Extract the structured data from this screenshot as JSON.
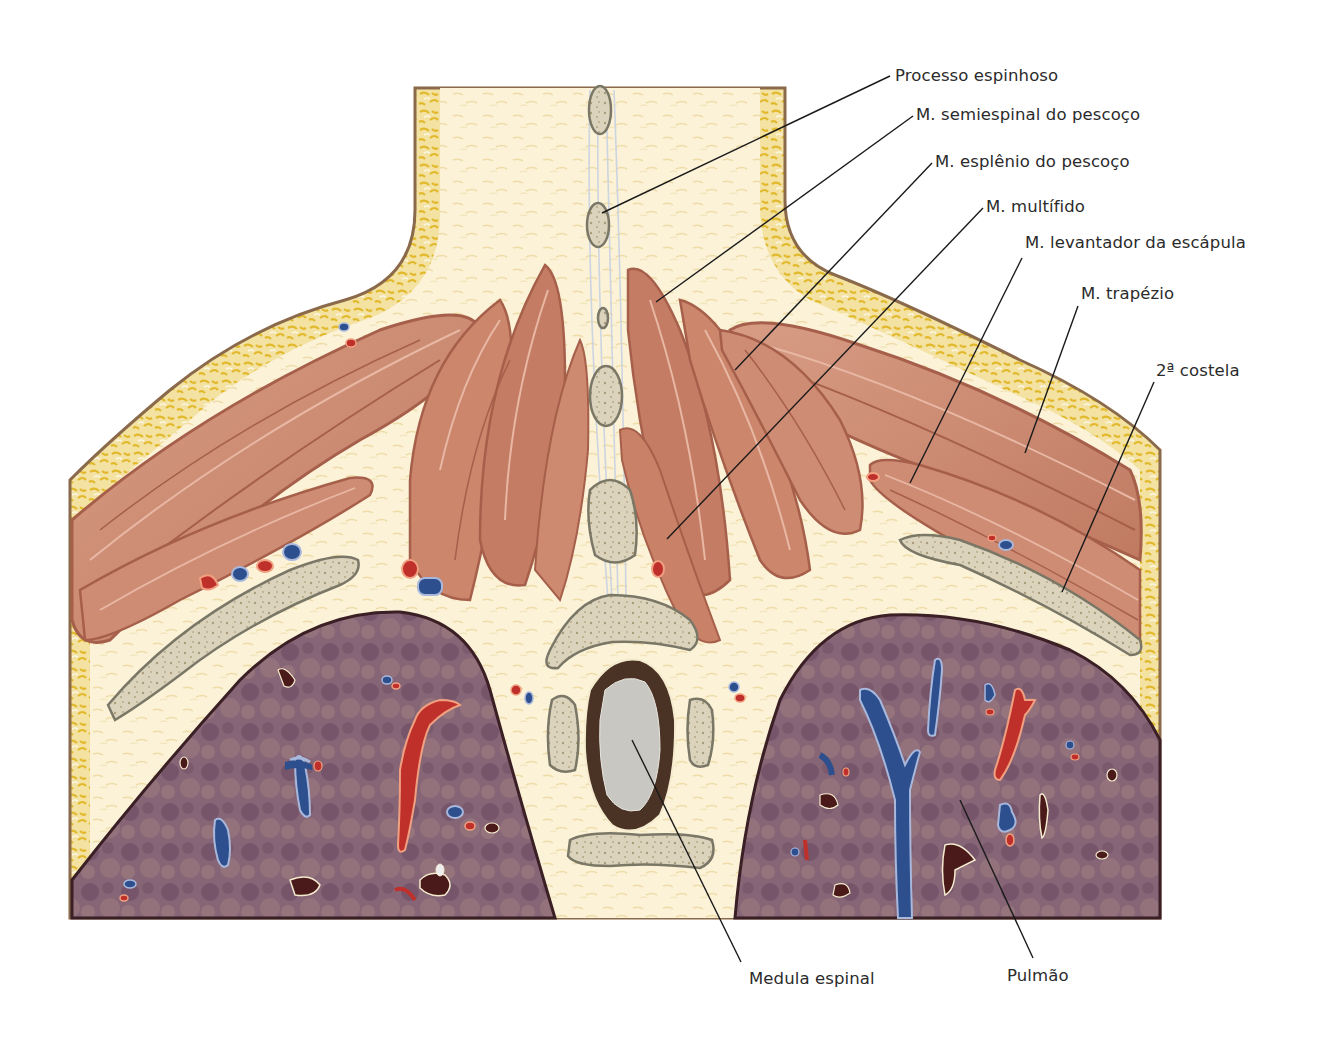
{
  "figure": {
    "colors": {
      "background": "#ffffff",
      "skin_line": "#8a6a4a",
      "fat_yellow": "#e9c94a",
      "fat_light": "#f6ecc8",
      "connective": "#fbf3dc",
      "muscle": "#c9826a",
      "muscle_dark": "#a65f4a",
      "muscle_light": "#e2ac96",
      "bone": "#dcd3bd",
      "bone_outline": "#7a7766",
      "spinal_cord": "#c9c7c2",
      "dura": "#4a3324",
      "lung": "#8a6878",
      "lung_dark": "#6a4a5e",
      "lung_outline": "#3a1f24",
      "artery": "#c0302a",
      "artery_rim": "#f0a080",
      "vein": "#2e4f8e",
      "vein_rim": "#a8b8dc",
      "bronchus": "#4a1a1a",
      "leader_line": "#1a1a1a",
      "label_text": "#2b2b2b"
    }
  },
  "labels": [
    {
      "id": "processo-espinhoso",
      "text": "Processo espinhoso",
      "x": 895,
      "y": 66,
      "line": {
        "x1": 890,
        "y1": 76,
        "x2": 602,
        "y2": 213
      }
    },
    {
      "id": "semiespinal",
      "text": "M. semiespinal do pescoço",
      "x": 916,
      "y": 105,
      "line": {
        "x1": 913,
        "y1": 116,
        "x2": 656,
        "y2": 302
      }
    },
    {
      "id": "esplenio",
      "text": "M. esplênio do pescoço",
      "x": 935,
      "y": 152,
      "line": {
        "x1": 932,
        "y1": 163,
        "x2": 735,
        "y2": 370
      }
    },
    {
      "id": "multifido",
      "text": "M. multífido",
      "x": 986,
      "y": 197,
      "line": {
        "x1": 983,
        "y1": 208,
        "x2": 667,
        "y2": 539
      }
    },
    {
      "id": "levantador",
      "text": "M. levantador da escápula",
      "x": 1025,
      "y": 233,
      "line": {
        "x1": 1022,
        "y1": 258,
        "x2": 910,
        "y2": 483
      }
    },
    {
      "id": "trapezio",
      "text": "M. trapézio",
      "x": 1081,
      "y": 284,
      "line": {
        "x1": 1078,
        "y1": 306,
        "x2": 1025,
        "y2": 453
      }
    },
    {
      "id": "segunda-costela",
      "text": "2ª costela",
      "x": 1156,
      "y": 361,
      "line": {
        "x1": 1154,
        "y1": 382,
        "x2": 1062,
        "y2": 592
      }
    },
    {
      "id": "medula-espinal",
      "text": "Medula espinal",
      "x": 749,
      "y": 969,
      "line": {
        "x1": 741,
        "y1": 962,
        "x2": 632,
        "y2": 740
      }
    },
    {
      "id": "pulmao",
      "text": "Pulmão",
      "x": 1007,
      "y": 966,
      "line": {
        "x1": 1033,
        "y1": 958,
        "x2": 960,
        "y2": 800
      }
    }
  ]
}
